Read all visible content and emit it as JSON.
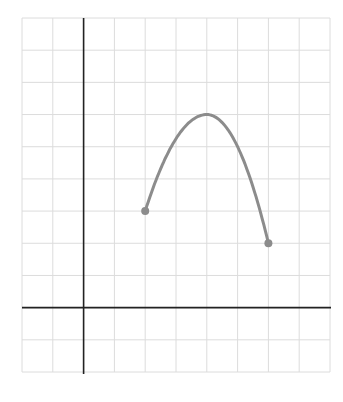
{
  "chart_data": {
    "type": "line",
    "title": "",
    "xlabel": "",
    "ylabel": "",
    "xlim": [
      -2,
      8
    ],
    "ylim": [
      -2,
      9
    ],
    "grid": true,
    "axes_origin": [
      0,
      0
    ],
    "grid_step": 1,
    "series": [
      {
        "name": "f(x)",
        "curve": "parabola-like arc (concave down)",
        "points": [
          {
            "x": 2,
            "y": 3,
            "label": "left endpoint",
            "closed": true
          },
          {
            "x": 4,
            "y": 6,
            "label": "maximum"
          },
          {
            "x": 6,
            "y": 2,
            "label": "right endpoint",
            "closed": true
          }
        ],
        "color": "#8c8c8c"
      }
    ],
    "legend": null
  },
  "style": {
    "grid_color": "#dcdcdc",
    "axis_color": "#222222",
    "curve_color": "#8c8c8c",
    "background": "#ffffff"
  }
}
